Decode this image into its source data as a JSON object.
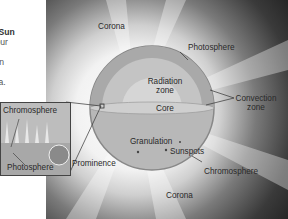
{
  "intro": {
    "title": "he Sun",
    "lines": [
      "o four",
      "re,",
      "ction",
      "e",
      "rona."
    ]
  },
  "labels": {
    "corona_top": "Corona",
    "photosphere": "Photosphere",
    "radiation_zone": "Radiation zone",
    "convection_zone": "Convection zone",
    "core": "Core",
    "granulation": "Granulation",
    "sunspots": "Sunspots",
    "prominence": "Prominence",
    "chromosphere": "Chromosphere",
    "corona_bottom": "Corona"
  },
  "inset": {
    "chromosphere": "Chromosphere",
    "photosphere": "Photosphere"
  }
}
